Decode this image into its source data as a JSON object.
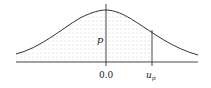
{
  "diagram": {
    "type": "normal-distribution-cumulative-area",
    "curve": "standard normal density",
    "shaded_region": "from left tail to u_p",
    "labels": {
      "area": "p",
      "center_tick": "0.0",
      "quantile_main": "u",
      "quantile_sub": "p"
    },
    "colors": {
      "stroke": "#333333",
      "shade_dots": "#9a9a9a",
      "background": "#ffffff"
    }
  }
}
